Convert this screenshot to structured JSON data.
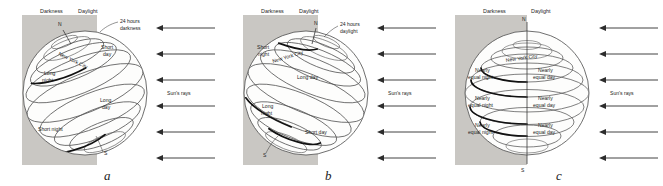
{
  "figure": {
    "type": "earth-seasons-diagram",
    "panel_count": 3,
    "shade_color": "#c9c7c3",
    "background_color": "#ffffff"
  },
  "common": {
    "darkness_label": "Darkness",
    "daylight_label": "Daylight",
    "north_pole": "N",
    "south_pole": "S",
    "suns_rays_label": "Sun's rays",
    "ray_count": 6,
    "city_label": "New York City"
  },
  "panels": [
    {
      "letter": "a",
      "season": "winter-solstice-northern-hemisphere",
      "pole_tilt": "north-pole-away-from-sun",
      "polar_callout": "24 hours\ndarkness",
      "polar_callout_line1": "24 hours",
      "polar_callout_line2": "darkness",
      "darkness_label": "Darkness",
      "daylight_label": "Daylight",
      "north_pole": "N",
      "south_pole": "S",
      "city_label": "New York City",
      "suns_rays_label": "Sun's rays",
      "annotations": [
        {
          "line1": "Short",
          "line2": "day",
          "side": "day"
        },
        {
          "line1": "Long",
          "line2": "night",
          "side": "night"
        },
        {
          "line1": "Long",
          "line2": "day",
          "side": "day"
        },
        {
          "line1": "Short night",
          "line2": "",
          "side": "night"
        }
      ],
      "ann_short_day_1": "Short",
      "ann_short_day_2": "day",
      "ann_long_night_1": "Long",
      "ann_long_night_2": "night",
      "ann_long_day_1": "Long",
      "ann_long_day_2": "day",
      "ann_short_night": "Short night"
    },
    {
      "letter": "b",
      "season": "summer-solstice-northern-hemisphere",
      "pole_tilt": "north-pole-toward-sun",
      "polar_callout": "24 hours\ndaylight",
      "polar_callout_line1": "24 hours",
      "polar_callout_line2": "daylight",
      "darkness_label": "Darkness",
      "daylight_label": "Daylight",
      "north_pole": "N",
      "south_pole": "S",
      "city_label": "New York City",
      "suns_rays_label": "Sun's rays",
      "annotations": [
        {
          "line1": "Short",
          "line2": "night",
          "side": "night"
        },
        {
          "line1": "Long day",
          "line2": "",
          "side": "day"
        },
        {
          "line1": "Long",
          "line2": "night",
          "side": "night"
        },
        {
          "line1": "Short day",
          "line2": "",
          "side": "day"
        }
      ],
      "ann_short_night_1": "Short",
      "ann_short_night_2": "night",
      "ann_long_day": "Long day",
      "ann_long_night_1": "Long",
      "ann_long_night_2": "night",
      "ann_short_day": "Short day"
    },
    {
      "letter": "c",
      "season": "equinox",
      "pole_tilt": "axis-vertical-no-tilt",
      "polar_callout": "",
      "darkness_label": "Darkness",
      "daylight_label": "Daylight",
      "north_pole": "N",
      "south_pole": "S",
      "city_label": "New York City",
      "suns_rays_label": "Sun's rays",
      "annotations": [
        {
          "line1": "Nearly",
          "line2": "equal night",
          "side": "night"
        },
        {
          "line1": "Nearly",
          "line2": "equal day",
          "side": "day"
        },
        {
          "line1": "Nearly",
          "line2": "equal night",
          "side": "night"
        },
        {
          "line1": "Nearly",
          "line2": "equal day",
          "side": "day"
        },
        {
          "line1": "Nearly",
          "line2": "equal night",
          "side": "night"
        },
        {
          "line1": "Nearly",
          "line2": "equal day",
          "side": "day"
        }
      ],
      "ann_nearly": "Nearly",
      "ann_equal_night": "equal night",
      "ann_equal_day": "equal day"
    }
  ]
}
